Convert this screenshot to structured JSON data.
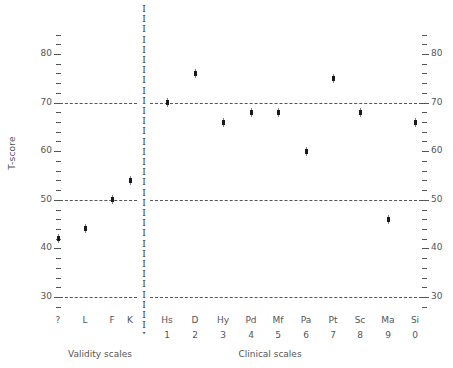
{
  "chart_data": {
    "type": "scatter",
    "title": "",
    "xlabel": "",
    "ylabel": "T-score",
    "ylim": [
      27,
      85
    ],
    "ytick_major": [
      30,
      40,
      50,
      60,
      70,
      80
    ],
    "ytick_minor": [
      28,
      32,
      34,
      36,
      38,
      42,
      44,
      46,
      48,
      52,
      54,
      56,
      58,
      62,
      64,
      66,
      68,
      72,
      74,
      76,
      78,
      82,
      84
    ],
    "reference_lines": [
      30,
      50,
      70
    ],
    "grid": false,
    "legend": null,
    "axis_right_mirrored": true,
    "groups": [
      {
        "name": "Validity scales",
        "label": "Validity scales"
      },
      {
        "name": "Clinical scales",
        "label": "Clinical scales"
      }
    ],
    "categories": [
      "?",
      "L",
      "F",
      "K",
      "Hs",
      "D",
      "Hy",
      "Pd",
      "Mf",
      "Pa",
      "Pt",
      "Sc",
      "Ma",
      "Si"
    ],
    "category_numbers": [
      "",
      "",
      "",
      "",
      "1",
      "2",
      "3",
      "4",
      "5",
      "6",
      "7",
      "8",
      "9",
      "0"
    ],
    "values": [
      42,
      44,
      50,
      54,
      70,
      76,
      66,
      68,
      68,
      60,
      75,
      68,
      46,
      66
    ],
    "points": [
      {
        "scale": "?",
        "number": "",
        "group": "Validity scales",
        "value": 42
      },
      {
        "scale": "L",
        "number": "",
        "group": "Validity scales",
        "value": 44
      },
      {
        "scale": "F",
        "number": "",
        "group": "Validity scales",
        "value": 50
      },
      {
        "scale": "K",
        "number": "",
        "group": "Validity scales",
        "value": 54
      },
      {
        "scale": "Hs",
        "number": "1",
        "group": "Clinical scales",
        "value": 70
      },
      {
        "scale": "D",
        "number": "2",
        "group": "Clinical scales",
        "value": 76
      },
      {
        "scale": "Hy",
        "number": "3",
        "group": "Clinical scales",
        "value": 66
      },
      {
        "scale": "Pd",
        "number": "4",
        "group": "Clinical scales",
        "value": 68
      },
      {
        "scale": "Mf",
        "number": "5",
        "group": "Clinical scales",
        "value": 68
      },
      {
        "scale": "Pa",
        "number": "6",
        "group": "Clinical scales",
        "value": 60
      },
      {
        "scale": "Pt",
        "number": "7",
        "group": "Clinical scales",
        "value": 75
      },
      {
        "scale": "Sc",
        "number": "8",
        "group": "Clinical scales",
        "value": 68
      },
      {
        "scale": "Ma",
        "number": "9",
        "group": "Clinical scales",
        "value": 46
      },
      {
        "scale": "Si",
        "number": "0",
        "group": "Clinical scales",
        "value": 66
      }
    ]
  },
  "axis": {
    "ylabel": "T-score",
    "left_labels": [
      "80",
      "70",
      "60",
      "50",
      "40",
      "30"
    ],
    "right_labels": [
      "80",
      "70",
      "60",
      "50",
      "40",
      "30"
    ]
  },
  "divider": {
    "glyph": "I",
    "count": 33
  },
  "groups": {
    "validity": "Validity scales",
    "clinical": "Clinical scales"
  },
  "colors": {
    "point": "#1a1a1a",
    "axis": "#555555",
    "reference_line": "#555555",
    "background": "#ffffff"
  }
}
